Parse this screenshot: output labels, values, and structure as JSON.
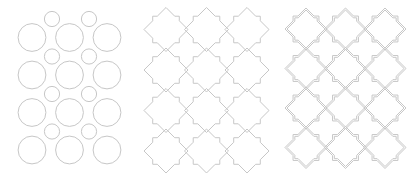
{
  "figure": {
    "width": 415,
    "height": 173,
    "background": "#ffffff",
    "line_color": "#c7c7c7",
    "line_width": 1,
    "panels": [
      {
        "name": "circle-grid",
        "type": "circles",
        "large_circles": {
          "radius": 13.9,
          "col_x": [
            32,
            69.5,
            107
          ],
          "row_y": [
            37.5,
            75,
            112.5,
            150
          ]
        },
        "small_circles": {
          "radius": 7.6,
          "col_x": [
            52,
            89
          ],
          "row_y": [
            19,
            56.5,
            94,
            131.5
          ]
        }
      },
      {
        "name": "star-cross-single-line",
        "type": "star-grid",
        "col_x": [
          166,
          206.5,
          247
        ],
        "row_y": [
          29.5,
          70,
          110.5,
          151
        ],
        "outer": {
          "tip_radius": 22,
          "corner_radius": 18.8
        }
      },
      {
        "name": "star-cross-double-line",
        "type": "star-grid",
        "col_x": [
          306,
          345.5,
          385
        ],
        "row_y": [
          29,
          68.5,
          108,
          147.5
        ],
        "outer": {
          "tip_radius": 21,
          "corner_radius": 18.3
        },
        "inner": {
          "tip_radius": 19,
          "corner_radius": 15.8
        }
      }
    ]
  }
}
